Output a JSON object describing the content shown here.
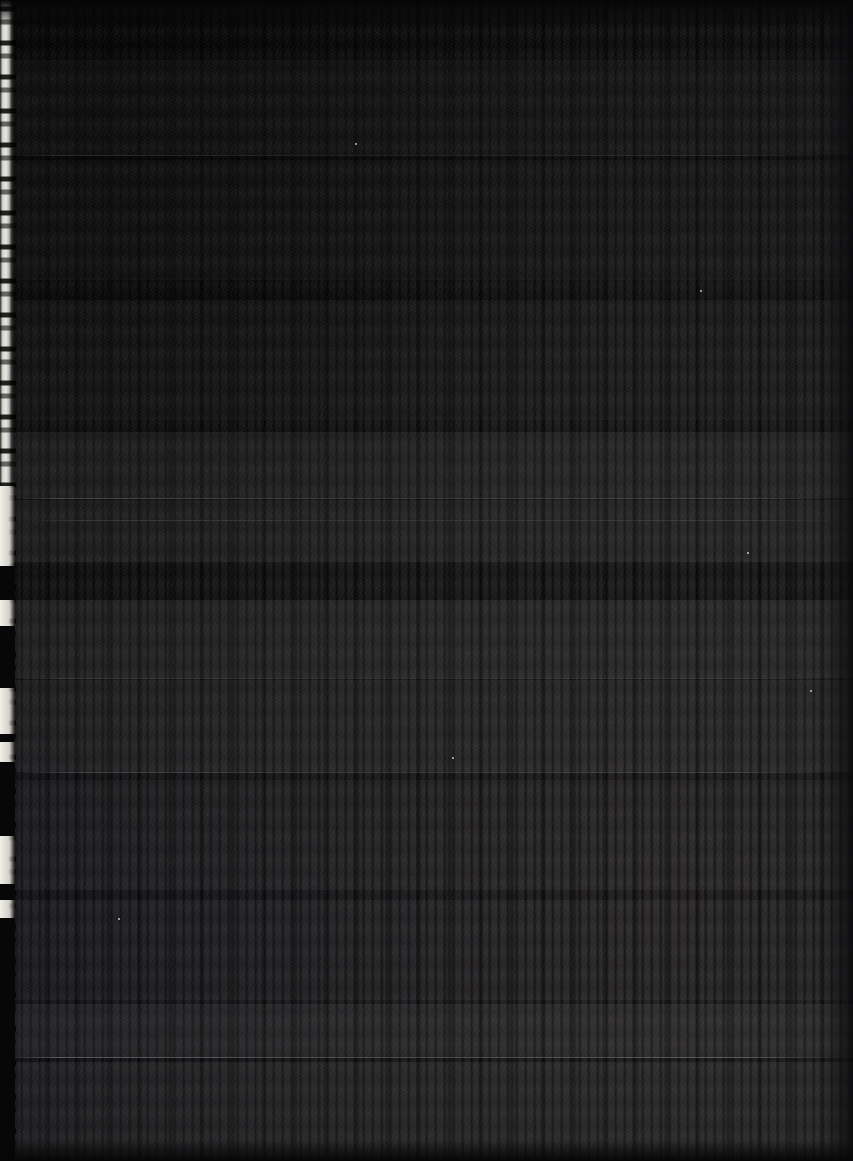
{
  "meta": {
    "domain": "Document",
    "kind": "scanned-page-photograph",
    "width": 853,
    "height": 1161,
    "legibility": "none",
    "note": "Severely underexposed photograph of a printed document page. No text is legible at any magnification; only tonal structure, text-line texture, horizontal separator rules and the lit left page edge are recoverable."
  },
  "palette": {
    "background": "#121214",
    "background_darkest": "#0a0a0c",
    "background_lightest": "#221f22",
    "page_edge_highlight": "#e9e7e0",
    "page_edge_mid": "#b9b8b2",
    "rule": "#bebec4",
    "speck": "#e1ded6"
  },
  "page": {
    "surface_label": "document-page",
    "vignette": "dark top-left, slightly lighter lower-right",
    "text_line_pitch_px": 23,
    "text_runs_full_width": true
  },
  "page_edge": {
    "label": "lit-left-page-edge",
    "x": 0,
    "width_px": 14,
    "profile": "ragged / torn",
    "notches": [
      {
        "top": 486,
        "height": 80
      },
      {
        "top": 600,
        "height": 26
      },
      {
        "top": 688,
        "height": 46
      },
      {
        "top": 742,
        "height": 20
      },
      {
        "top": 836,
        "height": 48
      },
      {
        "top": 900,
        "height": 18
      }
    ],
    "dark_gaps": [
      {
        "top": 566,
        "height": 34
      },
      {
        "top": 626,
        "height": 62
      },
      {
        "top": 734,
        "height": 8
      },
      {
        "top": 762,
        "height": 74
      },
      {
        "top": 884,
        "height": 16
      },
      {
        "top": 918,
        "height": 243
      }
    ]
  },
  "bands": [
    {
      "label": "text-block-upper",
      "top": 60,
      "height": 95,
      "intensity": 0.03
    },
    {
      "label": "text-block-upper-mid",
      "top": 160,
      "height": 120,
      "intensity": 0.026
    },
    {
      "label": "text-block-mid",
      "top": 300,
      "height": 120,
      "intensity": 0.028
    },
    {
      "label": "text-block-dense-a",
      "top": 432,
      "height": 66,
      "intensity": 0.06
    },
    {
      "label": "text-block-dense-b",
      "top": 500,
      "height": 62,
      "intensity": 0.055
    },
    {
      "label": "text-block-dense-c",
      "top": 600,
      "height": 78,
      "intensity": 0.058
    },
    {
      "label": "text-block-dense-d",
      "top": 680,
      "height": 92,
      "intensity": 0.05
    },
    {
      "label": "text-block-lower",
      "top": 780,
      "height": 110,
      "intensity": 0.034
    },
    {
      "label": "text-block-lower-mid",
      "top": 900,
      "height": 100,
      "intensity": 0.03
    },
    {
      "label": "text-block-footer-a",
      "top": 1004,
      "height": 54,
      "intensity": 0.062
    },
    {
      "label": "text-block-footer-b",
      "top": 1062,
      "height": 99,
      "intensity": 0.056
    }
  ],
  "rules": [
    {
      "label": "separator-rule-1",
      "top": 155,
      "left": 8,
      "right": 28,
      "opacity": 0.3
    },
    {
      "label": "separator-rule-2",
      "top": 498,
      "left": 8,
      "right": 10,
      "opacity": 0.55
    },
    {
      "label": "separator-rule-3",
      "top": 520,
      "left": 30,
      "right": 10,
      "opacity": 0.26
    },
    {
      "label": "separator-rule-4",
      "top": 678,
      "left": 12,
      "right": 14,
      "opacity": 0.34
    },
    {
      "label": "separator-rule-5",
      "top": 772,
      "left": 18,
      "right": 20,
      "opacity": 0.42
    },
    {
      "label": "separator-rule-6",
      "top": 1057,
      "left": 6,
      "right": 12,
      "opacity": 0.62
    }
  ],
  "specks": [
    {
      "x": 355,
      "y": 143,
      "size": 2
    },
    {
      "x": 700,
      "y": 290,
      "size": 2
    },
    {
      "x": 810,
      "y": 690,
      "size": 2
    },
    {
      "x": 747,
      "y": 552,
      "size": 2
    },
    {
      "x": 452,
      "y": 757,
      "size": 2
    },
    {
      "x": 118,
      "y": 918,
      "size": 2
    }
  ]
}
